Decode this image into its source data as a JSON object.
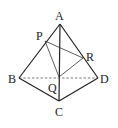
{
  "diagram": {
    "type": "tetrahedron",
    "labels": {
      "A": "A",
      "B": "B",
      "C": "C",
      "D": "D",
      "P": "P",
      "Q": "Q",
      "R": "R"
    },
    "points": {
      "A": [
        60,
        24
      ],
      "B": [
        19,
        78
      ],
      "C": [
        59,
        101
      ],
      "D": [
        98,
        78
      ],
      "P": [
        45,
        41
      ],
      "Q": [
        59,
        77
      ],
      "R": [
        83,
        58
      ]
    },
    "solid_edges": [
      "AB",
      "AC",
      "AD",
      "BC",
      "CD"
    ],
    "hidden_edges": [
      "BD"
    ],
    "cross_section": [
      "PQ",
      "QR",
      "PR"
    ],
    "colors": {
      "stroke": "#222222",
      "background": "#ffffff"
    }
  }
}
